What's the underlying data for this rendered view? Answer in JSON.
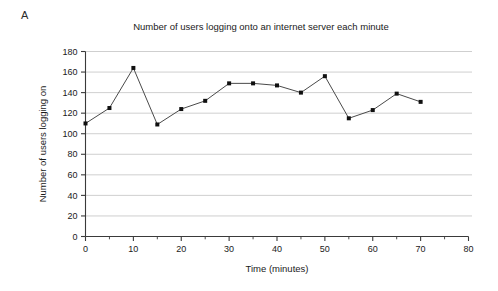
{
  "panel": {
    "letter": "A"
  },
  "chart_data": {
    "type": "line",
    "title": "Number of users logging onto an internet server each minute",
    "xlabel": "Time (minutes)",
    "ylabel": "Number of users logging on",
    "x": [
      0,
      5,
      10,
      15,
      20,
      25,
      30,
      35,
      40,
      45,
      50,
      55,
      60,
      65,
      70
    ],
    "values": [
      110,
      125,
      164,
      109,
      124,
      132,
      149,
      149,
      147,
      140,
      156,
      115,
      123,
      139,
      131
    ],
    "series": [
      {
        "name": "Users logging on",
        "values": [
          110,
          125,
          164,
          109,
          124,
          132,
          149,
          149,
          147,
          140,
          156,
          115,
          123,
          139,
          131
        ]
      }
    ],
    "xlim": [
      0,
      80
    ],
    "ylim": [
      0,
      180
    ],
    "xticks": [
      0,
      10,
      20,
      30,
      40,
      50,
      60,
      70,
      80
    ],
    "xticklabels": [
      "0",
      "10",
      "20",
      "30",
      "40",
      "50",
      "60",
      "70",
      "80"
    ],
    "xminorticks": [
      5,
      15,
      25,
      35,
      45,
      55,
      65,
      75
    ],
    "yticks": [
      0,
      20,
      40,
      60,
      80,
      100,
      120,
      140,
      160,
      180
    ],
    "yticklabels": [
      "0",
      "20",
      "40",
      "60",
      "80",
      "100",
      "120",
      "140",
      "160",
      "180"
    ],
    "grid": "horizontal",
    "legend": "none",
    "marker": "square",
    "line_color": "#4a4a4a",
    "marker_color": "#101010",
    "grid_color": "#c9c9c9",
    "axis_color": "#3a3a3a",
    "background": "#ffffff"
  }
}
